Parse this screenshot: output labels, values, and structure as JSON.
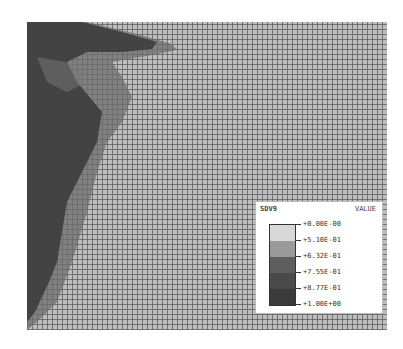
{
  "figure": {
    "type": "finite-element contour plot",
    "mesh": "structured quadrilateral grid"
  },
  "legend": {
    "variable": "SDV9",
    "header": "VALUE",
    "levels": [
      {
        "label": "+0.00E-00",
        "color": "#d8d8d8"
      },
      {
        "label": "+5.10E-01",
        "color": "#9a9a9a"
      },
      {
        "label": "+6.32E-01",
        "color": "#5e5e5e"
      },
      {
        "label": "+7.55E-01",
        "color": "#4a4a4a"
      },
      {
        "label": "+8.77E-01",
        "color": "#3a3a3a"
      },
      {
        "label": "+1.00E+00",
        "color": ""
      }
    ]
  },
  "colors": {
    "mesh_fill": "#bdbdbd",
    "mesh_lines": "#5a5a5a",
    "damage_high": "#3c3c3c",
    "damage_mid": "#6a6a6a"
  }
}
